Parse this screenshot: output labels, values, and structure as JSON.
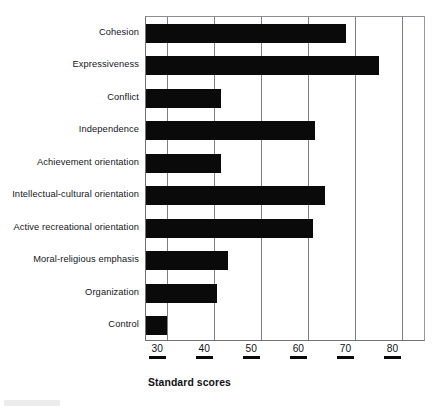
{
  "chart_data": {
    "type": "bar",
    "orientation": "horizontal",
    "title": "",
    "xlabel": "Standard scores",
    "ylabel": "",
    "xlim": [
      25.5,
      85.0
    ],
    "xticks": [
      30,
      40,
      50,
      60,
      70,
      80
    ],
    "xtick_labels": [
      "30",
      "40",
      "50",
      "60",
      "70",
      "80"
    ],
    "grid": "vertical gridlines at each x tick",
    "legend": "none",
    "bar_color": "#0a0a0a",
    "categories": [
      "Cohesion",
      "Expressiveness",
      "Conflict",
      "Independence",
      "Achievement orientation",
      "Intellectual-cultural orientation",
      "Active recreational orientation",
      "Moral-religious emphasis",
      "Organization",
      "Control"
    ],
    "values": [
      68,
      75,
      41.5,
      61.5,
      41.5,
      63.5,
      61,
      43,
      40.5,
      30
    ],
    "bars": [
      {
        "label": "Cohesion",
        "value": 68
      },
      {
        "label": "Expressiveness",
        "value": 75
      },
      {
        "label": "Conflict",
        "value": 41.5
      },
      {
        "label": "Independence",
        "value": 61.5
      },
      {
        "label": "Achievement orientation",
        "value": 41.5
      },
      {
        "label": "Intellectual-cultural orientation",
        "value": 63.5
      },
      {
        "label": "Active recreational orientation",
        "value": 61
      },
      {
        "label": "Moral-religious emphasis",
        "value": 43
      },
      {
        "label": "Organization",
        "value": 40.5
      },
      {
        "label": "Control",
        "value": 30
      }
    ]
  },
  "axis": {
    "x_title": "Standard scores",
    "ticks": [
      "30",
      "40",
      "50",
      "60",
      "70",
      "80"
    ]
  }
}
